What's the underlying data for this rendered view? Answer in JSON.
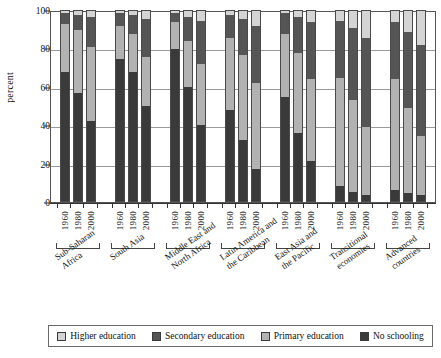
{
  "chart_data": {
    "type": "bar",
    "subtype": "stacked-percentage",
    "title": "",
    "xlabel": "",
    "ylabel": "percent",
    "ylim": [
      0,
      100
    ],
    "yticks": [
      0,
      20,
      40,
      60,
      80,
      100
    ],
    "grid": true,
    "legend_position": "bottom",
    "stack_order_bottom_to_top": [
      "No schooling",
      "Primary education",
      "Secondary education",
      "Higher education"
    ],
    "series": [
      {
        "name": "No schooling",
        "color": "#3a3a3a"
      },
      {
        "name": "Primary education",
        "color": "#b2b2b2"
      },
      {
        "name": "Secondary education",
        "color": "#555555"
      },
      {
        "name": "Higher education",
        "color": "#d4d4d4"
      }
    ],
    "groups": [
      {
        "name": "Sub-Saharan\nAfrica",
        "name_plain": "Sub-Saharan Africa",
        "bars": [
          {
            "year": "1960",
            "values": {
              "No schooling": 68,
              "Primary education": 25,
              "Secondary education": 6,
              "Higher education": 1
            }
          },
          {
            "year": "1980",
            "values": {
              "No schooling": 57,
              "Primary education": 33,
              "Secondary education": 8,
              "Higher education": 2
            }
          },
          {
            "year": "2000",
            "values": {
              "No schooling": 42,
              "Primary education": 39,
              "Secondary education": 16,
              "Higher education": 3
            }
          }
        ]
      },
      {
        "name": "South Asia",
        "name_plain": "South Asia",
        "bars": [
          {
            "year": "1960",
            "values": {
              "No schooling": 75,
              "Primary education": 17,
              "Secondary education": 7,
              "Higher education": 1
            }
          },
          {
            "year": "1980",
            "values": {
              "No schooling": 68,
              "Primary education": 20,
              "Secondary education": 10,
              "Higher education": 2
            }
          },
          {
            "year": "2000",
            "values": {
              "No schooling": 50,
              "Primary education": 26,
              "Secondary education": 20,
              "Higher education": 4
            }
          }
        ]
      },
      {
        "name": "Middle East and\nNorth Africa",
        "name_plain": "Middle East and North Africa",
        "bars": [
          {
            "year": "1960",
            "values": {
              "No schooling": 80,
              "Primary education": 14,
              "Secondary education": 5,
              "Higher education": 1
            }
          },
          {
            "year": "1980",
            "values": {
              "No schooling": 60,
              "Primary education": 24,
              "Secondary education": 13,
              "Higher education": 3
            }
          },
          {
            "year": "2000",
            "values": {
              "No schooling": 40,
              "Primary education": 32,
              "Secondary education": 23,
              "Higher education": 5
            }
          }
        ]
      },
      {
        "name": "Latin America and\nthe Caribbean",
        "name_plain": "Latin America and the Caribbean",
        "bars": [
          {
            "year": "1960",
            "values": {
              "No schooling": 48,
              "Primary education": 38,
              "Secondary education": 12,
              "Higher education": 2
            }
          },
          {
            "year": "1980",
            "values": {
              "No schooling": 32,
              "Primary education": 45,
              "Secondary education": 19,
              "Higher education": 4
            }
          },
          {
            "year": "2000",
            "values": {
              "No schooling": 17,
              "Primary education": 45,
              "Secondary education": 30,
              "Higher education": 8
            }
          }
        ]
      },
      {
        "name": "East Asia and\nthe Pacific",
        "name_plain": "East Asia and the Pacific",
        "bars": [
          {
            "year": "1960",
            "values": {
              "No schooling": 55,
              "Primary education": 33,
              "Secondary education": 11,
              "Higher education": 1
            }
          },
          {
            "year": "1980",
            "values": {
              "No schooling": 36,
              "Primary education": 42,
              "Secondary education": 19,
              "Higher education": 3
            }
          },
          {
            "year": "2000",
            "values": {
              "No schooling": 21,
              "Primary education": 43,
              "Secondary education": 30,
              "Higher education": 6
            }
          }
        ]
      },
      {
        "name": "Transitional\neconomies",
        "name_plain": "Transitional economies",
        "bars": [
          {
            "year": "1960",
            "values": {
              "No schooling": 8,
              "Primary education": 57,
              "Secondary education": 30,
              "Higher education": 5
            }
          },
          {
            "year": "1980",
            "values": {
              "No schooling": 5,
              "Primary education": 48,
              "Secondary education": 38,
              "Higher education": 9
            }
          },
          {
            "year": "2000",
            "values": {
              "No schooling": 3,
              "Primary education": 36,
              "Secondary education": 47,
              "Higher education": 14
            }
          }
        ]
      },
      {
        "name": "Advanced\ncountries",
        "name_plain": "Advanced countries",
        "bars": [
          {
            "year": "1960",
            "values": {
              "No schooling": 6,
              "Primary education": 58,
              "Secondary education": 30,
              "Higher education": 6
            }
          },
          {
            "year": "1980",
            "values": {
              "No schooling": 4,
              "Primary education": 45,
              "Secondary education": 40,
              "Higher education": 11
            }
          },
          {
            "year": "2000",
            "values": {
              "No schooling": 3,
              "Primary education": 31,
              "Secondary education": 48,
              "Higher education": 18
            }
          }
        ]
      }
    ]
  },
  "axis": {
    "ylabel": "percent",
    "yticks": [
      "0",
      "20",
      "40",
      "60",
      "80",
      "100"
    ]
  },
  "legend": {
    "items": [
      {
        "label": "Higher education",
        "color": "#d4d4d4"
      },
      {
        "label": "Secondary education",
        "color": "#555555"
      },
      {
        "label": "Primary education",
        "color": "#b2b2b2"
      },
      {
        "label": "No schooling",
        "color": "#3a3a3a"
      }
    ]
  }
}
